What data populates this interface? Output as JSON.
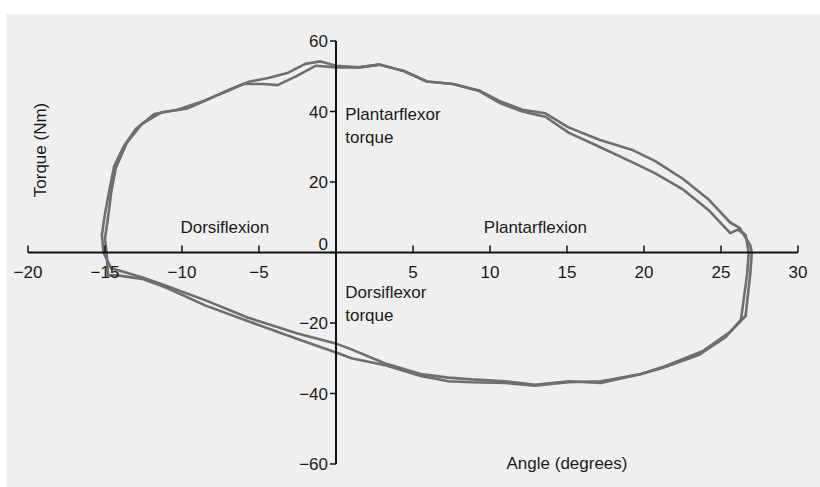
{
  "chart_data": {
    "type": "line",
    "title": "",
    "xlabel": "Angle (degrees)",
    "ylabel": "Torque (Nm)",
    "xlim": [
      -20,
      30
    ],
    "ylim": [
      -60,
      60
    ],
    "x_ticks": [
      -20,
      -15,
      -10,
      -5,
      0,
      5,
      10,
      15,
      20,
      25,
      30
    ],
    "x_tick_labels": [
      "−20",
      "−15",
      "−10",
      "−5",
      "",
      "5",
      "10",
      "15",
      "20",
      "25",
      "30"
    ],
    "y_ticks": [
      60,
      40,
      20,
      0,
      -20,
      -40,
      -60
    ],
    "y_tick_labels": [
      "60",
      "40",
      "20",
      "0",
      "−20",
      "−40",
      "−60"
    ],
    "grid": false,
    "legend": "none",
    "line_color": "#6e6e6e",
    "annotations": [
      {
        "text": "Plantarflexor",
        "x": 0.6,
        "y": 37.5
      },
      {
        "text": "torque",
        "x": 0.6,
        "y": 31
      },
      {
        "text": "Dorsiflexion",
        "x": -10.1,
        "y": 5.5
      },
      {
        "text": "Plantarflexion",
        "x": 9.6,
        "y": 5.5
      },
      {
        "text": "Dorsiflexor",
        "x": 0.6,
        "y": -13
      },
      {
        "text": "torque",
        "x": 0.6,
        "y": -19.5
      }
    ],
    "series": [
      {
        "name": "trial-1",
        "points": [
          [
            -14.9,
            0
          ],
          [
            -15.0,
            4
          ],
          [
            -14.8,
            10
          ],
          [
            -14.6,
            17
          ],
          [
            -14.3,
            24
          ],
          [
            -13.6,
            31
          ],
          [
            -12.6,
            36.5
          ],
          [
            -11.3,
            39.8
          ],
          [
            -9.7,
            40.8
          ],
          [
            -8.3,
            43.5
          ],
          [
            -6.8,
            46.5
          ],
          [
            -5.6,
            48.5
          ],
          [
            -4.4,
            49.5
          ],
          [
            -3.1,
            51
          ],
          [
            -2.0,
            53.5
          ],
          [
            -1.0,
            54.2
          ],
          [
            0.0,
            53
          ],
          [
            1.5,
            52.5
          ],
          [
            2.8,
            53.3
          ],
          [
            4.4,
            51.5
          ],
          [
            5.9,
            48.5
          ],
          [
            7.6,
            47.8
          ],
          [
            9.3,
            46
          ],
          [
            10.6,
            43
          ],
          [
            12.1,
            40.5
          ],
          [
            13.6,
            39.5
          ],
          [
            15.1,
            35.5
          ],
          [
            17.1,
            32
          ],
          [
            19.3,
            29
          ],
          [
            20.7,
            26
          ],
          [
            22.5,
            21
          ],
          [
            24.2,
            15
          ],
          [
            25.6,
            8.5
          ],
          [
            26.2,
            7
          ],
          [
            26.9,
            2
          ],
          [
            27.0,
            0
          ],
          [
            26.9,
            -6
          ],
          [
            26.6,
            -18
          ],
          [
            25.6,
            -22.5
          ],
          [
            23.8,
            -28
          ],
          [
            21.2,
            -32.5
          ],
          [
            19.8,
            -34.5
          ],
          [
            17.2,
            -36.5
          ],
          [
            15.1,
            -36.8
          ],
          [
            12.9,
            -37.8
          ],
          [
            11.0,
            -37
          ],
          [
            8.8,
            -36.8
          ],
          [
            7.3,
            -36.5
          ],
          [
            5.5,
            -35
          ],
          [
            3.2,
            -32
          ],
          [
            1.0,
            -30
          ],
          [
            0.1,
            -28.5
          ],
          [
            -2.5,
            -24.5
          ],
          [
            -5.7,
            -19.5
          ],
          [
            -8.5,
            -15
          ],
          [
            -11.0,
            -10
          ],
          [
            -12.6,
            -7.5
          ],
          [
            -14.2,
            -6.5
          ],
          [
            -14.8,
            -6.5
          ],
          [
            -14.9,
            0
          ]
        ]
      },
      {
        "name": "trial-2",
        "points": [
          [
            -15.1,
            0
          ],
          [
            -15.2,
            5
          ],
          [
            -15.0,
            11
          ],
          [
            -14.7,
            18
          ],
          [
            -14.4,
            24.5
          ],
          [
            -13.8,
            30
          ],
          [
            -13.0,
            35
          ],
          [
            -11.8,
            39.3
          ],
          [
            -10.3,
            40.5
          ],
          [
            -8.6,
            43
          ],
          [
            -7.2,
            45.5
          ],
          [
            -6.0,
            47.8
          ],
          [
            -4.7,
            47.8
          ],
          [
            -3.8,
            47.5
          ],
          [
            -2.6,
            50
          ],
          [
            -1.3,
            53
          ],
          [
            0.0,
            52.5
          ],
          [
            1.5,
            52.5
          ],
          [
            2.8,
            53.3
          ],
          [
            4.4,
            51.5
          ],
          [
            5.9,
            48.5
          ],
          [
            7.6,
            47.8
          ],
          [
            9.3,
            45.8
          ],
          [
            10.6,
            42.5
          ],
          [
            12.1,
            40
          ],
          [
            13.6,
            38.5
          ],
          [
            15.1,
            34
          ],
          [
            17.1,
            30
          ],
          [
            19.3,
            25.5
          ],
          [
            20.7,
            22.5
          ],
          [
            22.5,
            18
          ],
          [
            24.2,
            12
          ],
          [
            25.6,
            5.5
          ],
          [
            26.1,
            6.5
          ],
          [
            26.6,
            5
          ],
          [
            26.8,
            0
          ],
          [
            26.7,
            -6
          ],
          [
            26.3,
            -19
          ],
          [
            25.3,
            -24
          ],
          [
            23.6,
            -29
          ],
          [
            21.2,
            -32.8
          ],
          [
            19.8,
            -34.5
          ],
          [
            17.2,
            -37
          ],
          [
            15.1,
            -36.5
          ],
          [
            12.9,
            -37.5
          ],
          [
            11.0,
            -36.5
          ],
          [
            8.8,
            -36
          ],
          [
            7.3,
            -35.5
          ],
          [
            5.5,
            -34.5
          ],
          [
            3.2,
            -31.5
          ],
          [
            1.0,
            -27.5
          ],
          [
            0.1,
            -26
          ],
          [
            -2.5,
            -23
          ],
          [
            -5.7,
            -18.5
          ],
          [
            -8.5,
            -13.5
          ],
          [
            -11.0,
            -9.5
          ],
          [
            -12.6,
            -7
          ],
          [
            -14.2,
            -5
          ],
          [
            -14.6,
            -4.5
          ],
          [
            -15.1,
            0
          ]
        ]
      }
    ]
  }
}
